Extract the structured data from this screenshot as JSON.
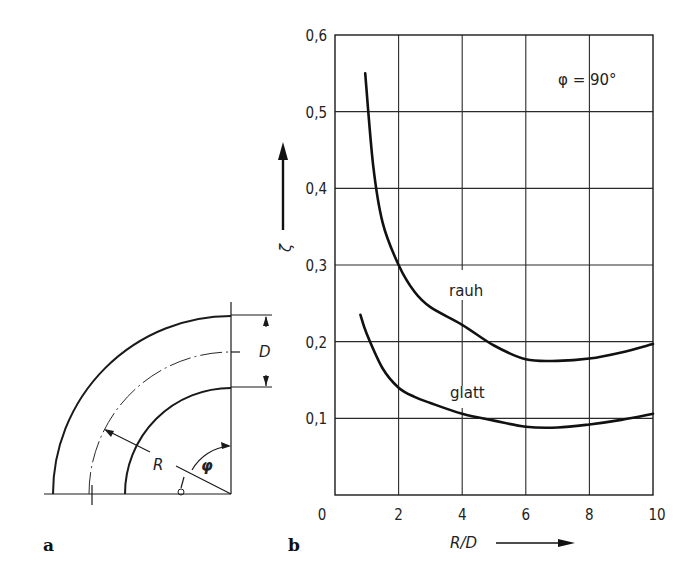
{
  "panels": {
    "a": {
      "label": "a"
    },
    "b": {
      "label": "b"
    }
  },
  "diagram": {
    "labels": {
      "diameter": "D",
      "radius": "R",
      "angle": "φ"
    }
  },
  "chart_data": {
    "type": "line",
    "title": "",
    "annotation": "φ = 90°",
    "xlabel": "R/D",
    "ylabel": "ζ",
    "xlim": [
      0,
      10
    ],
    "ylim": [
      0,
      0.6
    ],
    "grid": true,
    "xticks": [
      "0",
      "2",
      "4",
      "6",
      "8",
      "10"
    ],
    "yticks": [
      "0,1",
      "0,2",
      "0,3",
      "0,4",
      "0,5",
      "0,6"
    ],
    "series": [
      {
        "name": "rauh",
        "x": [
          0.95,
          1.2,
          1.5,
          2.0,
          2.5,
          3.0,
          4.0,
          5.0,
          6.0,
          7.0,
          8.0,
          9.0,
          10.0
        ],
        "values": [
          0.55,
          0.43,
          0.355,
          0.3,
          0.265,
          0.245,
          0.222,
          0.195,
          0.177,
          0.175,
          0.178,
          0.186,
          0.197
        ]
      },
      {
        "name": "glatt",
        "x": [
          0.8,
          1.0,
          1.5,
          2.0,
          2.5,
          3.0,
          4.0,
          5.0,
          6.0,
          7.0,
          8.0,
          9.0,
          10.0
        ],
        "values": [
          0.235,
          0.21,
          0.165,
          0.14,
          0.128,
          0.12,
          0.106,
          0.097,
          0.089,
          0.088,
          0.092,
          0.098,
          0.106
        ]
      }
    ],
    "legend": {
      "position": "inline",
      "entries": [
        "rauh",
        "glatt"
      ]
    }
  }
}
